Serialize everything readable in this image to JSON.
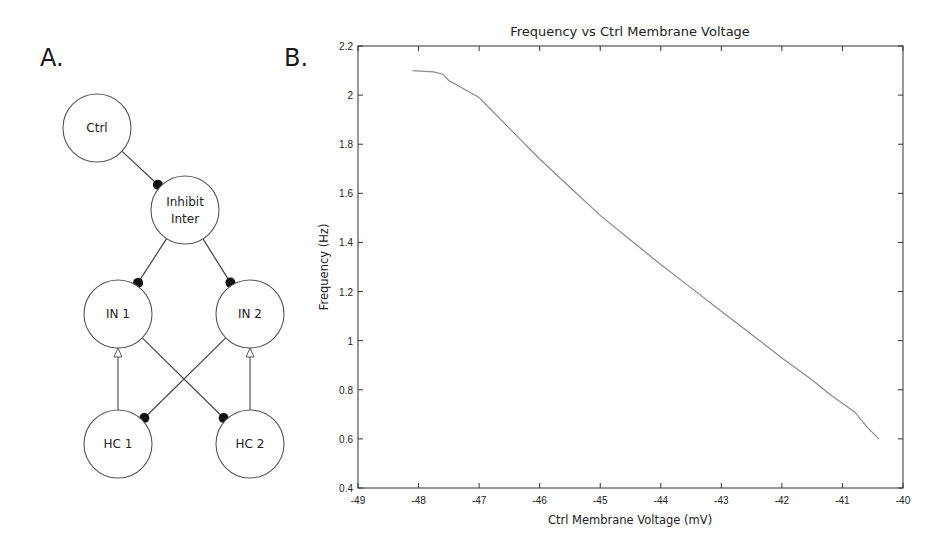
{
  "panels": {
    "a": {
      "label": "A."
    },
    "b": {
      "label": "B."
    }
  },
  "diagram": {
    "nodes": [
      {
        "id": "ctrl",
        "lines": [
          "Ctrl"
        ],
        "cx": 97,
        "cy": 128
      },
      {
        "id": "inhibit_inter",
        "lines": [
          "Inhibit",
          "Inter"
        ],
        "cx": 185,
        "cy": 210
      },
      {
        "id": "in1",
        "lines": [
          "IN 1"
        ],
        "cx": 118,
        "cy": 314
      },
      {
        "id": "in2",
        "lines": [
          "IN 2"
        ],
        "cx": 250,
        "cy": 314
      },
      {
        "id": "hc1",
        "lines": [
          "HC 1"
        ],
        "cx": 118,
        "cy": 444
      },
      {
        "id": "hc2",
        "lines": [
          "HC 2"
        ],
        "cx": 250,
        "cy": 444
      }
    ],
    "edges": [
      {
        "from": "ctrl",
        "to": "inhibit_inter",
        "type": "inhibitory"
      },
      {
        "from": "inhibit_inter",
        "to": "in1",
        "type": "inhibitory"
      },
      {
        "from": "inhibit_inter",
        "to": "in2",
        "type": "inhibitory"
      },
      {
        "from": "hc1",
        "to": "in1",
        "type": "excitatory"
      },
      {
        "from": "hc2",
        "to": "in2",
        "type": "excitatory"
      },
      {
        "from": "in1",
        "to": "hc2",
        "type": "inhibitory"
      },
      {
        "from": "in2",
        "to": "hc1",
        "type": "inhibitory"
      }
    ]
  },
  "chart_data": {
    "type": "line",
    "title": "Frequency vs Ctrl Membrane Voltage",
    "xlabel": "Ctrl Membrane Voltage (mV)",
    "ylabel": "Frequency (Hz)",
    "xlim": [
      -49,
      -40
    ],
    "ylim": [
      0.4,
      2.2
    ],
    "xticks": [
      -49,
      -48,
      -47,
      -46,
      -45,
      -44,
      -43,
      -42,
      -41,
      -40
    ],
    "yticks": [
      0.4,
      0.6,
      0.8,
      1,
      1.2,
      1.4,
      1.6,
      1.8,
      2,
      2.2
    ],
    "xtick_labels": [
      "-49",
      "-48",
      "-47",
      "-46",
      "-45",
      "-44",
      "-43",
      "-42",
      "-41",
      "-40"
    ],
    "ytick_labels": [
      "0.4",
      "0.6",
      "0.8",
      "1",
      "1.2",
      "1.4",
      "1.6",
      "1.8",
      "2",
      "2.2"
    ],
    "grid": false,
    "legend": null,
    "series": [
      {
        "name": "Frequency",
        "color": "#8a8a8a",
        "x": [
          -48.1,
          -47.75,
          -47.6,
          -47.5,
          -47.0,
          -46.5,
          -46.0,
          -45.5,
          -45.0,
          -44.5,
          -44.0,
          -43.5,
          -43.0,
          -42.5,
          -42.0,
          -41.5,
          -41.2,
          -41.0,
          -40.8,
          -40.6,
          -40.4
        ],
        "y": [
          2.1,
          2.095,
          2.085,
          2.06,
          1.99,
          1.865,
          1.74,
          1.625,
          1.51,
          1.41,
          1.31,
          1.215,
          1.12,
          1.025,
          0.93,
          0.84,
          0.78,
          0.745,
          0.71,
          0.65,
          0.6
        ]
      }
    ]
  }
}
